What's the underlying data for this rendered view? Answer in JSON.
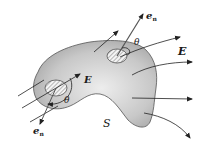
{
  "diagram": {
    "labels": {
      "en_top": "e",
      "en_top_sub": "n",
      "en_bottom": "e",
      "en_bottom_sub": "n",
      "theta_top": "θ",
      "theta_left": "θ",
      "E_right": "E",
      "E_center": "E",
      "S": "S"
    },
    "colors": {
      "surface_fill_dark": "#9a9a9a",
      "surface_fill_light": "#e6e6e6",
      "outline": "#555555",
      "arrow": "#222222",
      "patch_fill": "#f2f2f2",
      "background": "#ffffff"
    },
    "elements": [
      "closed surface S",
      "area element (top) with outward normal e_n and angle θ to field E",
      "area element (left) with normal e_n and angle θ, field lines entering surface",
      "electric field lines E exiting surface on the right"
    ]
  }
}
